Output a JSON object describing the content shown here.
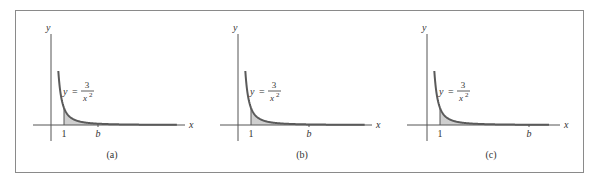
{
  "figure": {
    "panels": [
      {
        "caption": "(a)",
        "x_label": "x",
        "y_label": "y",
        "tick_one": "1",
        "tick_b": "b",
        "equation_lhs": "y =",
        "equation_num": "3",
        "equation_den": "x",
        "equation_exp": "2",
        "b_value": 3.6
      },
      {
        "caption": "(b)",
        "x_label": "x",
        "y_label": "y",
        "tick_one": "1",
        "tick_b": "b",
        "equation_lhs": "y =",
        "equation_num": "3",
        "equation_den": "x",
        "equation_exp": "2",
        "b_value": 5.5
      },
      {
        "caption": "(c)",
        "x_label": "x",
        "y_label": "y",
        "tick_one": "1",
        "tick_b": "b",
        "equation_lhs": "y =",
        "equation_num": "3",
        "equation_den": "x",
        "equation_exp": "2",
        "b_value": 7.8
      }
    ],
    "colors": {
      "curve": "#5a5a5a",
      "shade": "#cfcfcf",
      "axis": "#555555",
      "border": "#8a8a8a"
    }
  },
  "chart_data": [
    {
      "type": "line",
      "title": "(a)",
      "function": "y = 3/x^2",
      "xlabel": "x",
      "ylabel": "y",
      "shaded_region": {
        "from": 1,
        "to": "b"
      },
      "x_ticks": [
        "1",
        "b"
      ]
    },
    {
      "type": "line",
      "title": "(b)",
      "function": "y = 3/x^2",
      "xlabel": "x",
      "ylabel": "y",
      "shaded_region": {
        "from": 1,
        "to": "b"
      },
      "x_ticks": [
        "1",
        "b"
      ]
    },
    {
      "type": "line",
      "title": "(c)",
      "function": "y = 3/x^2",
      "xlabel": "x",
      "ylabel": "y",
      "shaded_region": {
        "from": 1,
        "to": "b"
      },
      "x_ticks": [
        "1",
        "b"
      ]
    }
  ]
}
